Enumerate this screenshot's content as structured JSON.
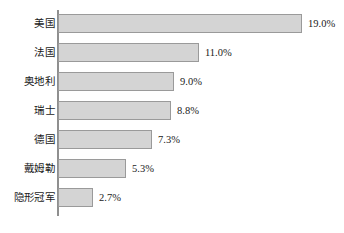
{
  "chart_data": {
    "type": "bar",
    "orientation": "horizontal",
    "title": "",
    "subtitle": "",
    "xlabel": "",
    "ylabel": "",
    "grid": false,
    "legend": false,
    "axis_color": "#8f8f8f",
    "bar_fill": "#d4d4d4",
    "bar_stroke": "#9a9a9a",
    "text_color": "#1a1a1a",
    "xlim": [
      0,
      19.0
    ],
    "value_suffix": "%",
    "categories": [
      "美国",
      "法国",
      "奥地利",
      "瑞士",
      "德国",
      "戴姆勒",
      "隐形冠军"
    ],
    "values": [
      19.0,
      11.0,
      9.0,
      8.8,
      7.3,
      5.3,
      2.7
    ],
    "value_labels": [
      "19.0%",
      "11.0%",
      "9.0%",
      "8.8%",
      "7.3%",
      "5.3%",
      "2.7%"
    ],
    "bars": [
      {
        "category": "美国",
        "value": 19.0,
        "label": "19.0%"
      },
      {
        "category": "法国",
        "value": 11.0,
        "label": "11.0%"
      },
      {
        "category": "奥地利",
        "value": 9.0,
        "label": "9.0%"
      },
      {
        "category": "瑞士",
        "value": 8.8,
        "label": "8.8%"
      },
      {
        "category": "德国",
        "value": 7.3,
        "label": "7.3%"
      },
      {
        "category": "戴姆勒",
        "value": 5.3,
        "label": "5.3%"
      },
      {
        "category": "隐形冠军",
        "value": 2.7,
        "label": "2.7%"
      }
    ]
  }
}
